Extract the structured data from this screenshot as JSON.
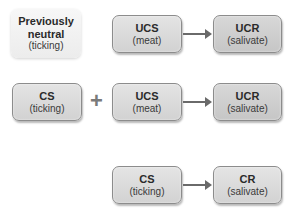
{
  "diagram": {
    "rows": [
      {
        "stage": "before",
        "nodes": [
          {
            "id": "neutral",
            "title_lines": [
              "Previously",
              "neutral"
            ],
            "subtitle": "(ticking)"
          },
          {
            "id": "ucs1",
            "title": "UCS",
            "subtitle": "(meat)"
          },
          {
            "id": "ucr1",
            "title": "UCR",
            "subtitle": "(salivate)"
          }
        ],
        "connectors": [
          {
            "from": "ucs1",
            "to": "ucr1",
            "type": "arrow"
          }
        ]
      },
      {
        "stage": "during",
        "nodes": [
          {
            "id": "cs1",
            "title": "CS",
            "subtitle": "(ticking)"
          },
          {
            "id": "ucs2",
            "title": "UCS",
            "subtitle": "(meat)"
          },
          {
            "id": "ucr2",
            "title": "UCR",
            "subtitle": "(salivate)"
          }
        ],
        "operator": "+",
        "connectors": [
          {
            "from": "cs1",
            "to": "ucs2",
            "type": "plus"
          },
          {
            "from": "ucs2",
            "to": "ucr2",
            "type": "arrow"
          }
        ]
      },
      {
        "stage": "after",
        "nodes": [
          {
            "id": "cs2",
            "title": "CS",
            "subtitle": "(ticking)"
          },
          {
            "id": "cr",
            "title": "CR",
            "subtitle": "(salivate)"
          }
        ],
        "connectors": [
          {
            "from": "cs2",
            "to": "cr",
            "type": "arrow"
          }
        ]
      }
    ]
  },
  "colors": {
    "box_fill": "#d8d8d8",
    "box_fill_light": "#f2f2f2",
    "box_border": "#8c8c8c",
    "arrow": "#6a6a6a",
    "text": "#2a2a2a"
  }
}
